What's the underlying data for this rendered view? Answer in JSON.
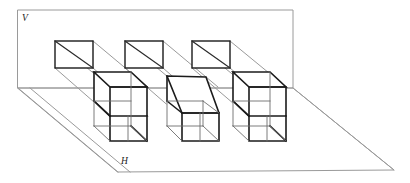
{
  "figure": {
    "labels": {
      "vertical_plane": "V",
      "horizontal_plane": "H"
    },
    "colors": {
      "background": "#ffffff",
      "plane_edge": "#9a9a9a",
      "projection_line": "#9a9a9a",
      "solid_edge": "#1b1b1b",
      "hidden_edge": "#6d6d6d",
      "face_fill": "#ffffff"
    },
    "geometry": {
      "vertical_plane_polygon": "18,10 293,10 293,88 18,88",
      "horizontal_plane_polygon": "18,88 293,88 394,170 118,172",
      "v_label_position": {
        "x": 22,
        "y": 21
      },
      "h_label_position": {
        "x": 121,
        "y": 164
      },
      "projection_rects": [
        {
          "name": "projection-rect-left",
          "x": 55,
          "y": 41,
          "width": 38,
          "height": 27,
          "diagonal": "55,41 93,68"
        },
        {
          "name": "projection-rect-middle",
          "x": 125,
          "y": 41,
          "width": 38,
          "height": 27,
          "diagonal": "125,41 163,68"
        },
        {
          "name": "projection-rect-right",
          "x": 192,
          "y": 41,
          "width": 38,
          "height": 27,
          "diagonal": "192,41 230,68"
        }
      ],
      "solids": [
        {
          "name": "solid-cube-left",
          "kind": "cube",
          "front_face": "110,87 147,87 147,116 110,116",
          "top_back": "94,72 131,72",
          "base_front": "110,141 147,141",
          "depth_offset": {
            "dx": -16,
            "dy": -15
          }
        },
        {
          "name": "solid-wedge-middle",
          "kind": "sloped-prism",
          "slanted_top": "167,76 206,77 215,113 182,113",
          "base_front": "182,141 219,141",
          "depth_offset": {
            "dx": -16,
            "dy": -15
          }
        },
        {
          "name": "solid-cube-right",
          "kind": "cube",
          "front_face": "249,87 286,87 286,116 249,116",
          "top_back": "233,72 270,72",
          "base_front": "249,141 286,141",
          "depth_offset": {
            "dx": -16,
            "dy": -15
          }
        }
      ]
    }
  }
}
